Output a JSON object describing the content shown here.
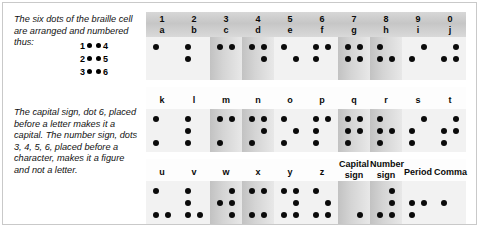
{
  "text": {
    "paragraph_1": "The six dots of the braille cell are arranged and numbered thus:",
    "paragraph_2": "The capital sign, dot 6, placed before a letter makes it a capital. The number sign, dots 3, 4, 5, 6, placed before a character, makes it a figure and not a letter."
  },
  "legend": {
    "rows": [
      {
        "left_number": "1",
        "right_number": "4"
      },
      {
        "left_number": "2",
        "right_number": "5"
      },
      {
        "left_number": "3",
        "right_number": "6"
      }
    ]
  },
  "table": {
    "rows": [
      {
        "header_style": "two-line",
        "headers": [
          {
            "top": "1",
            "bottom": "a"
          },
          {
            "top": "2",
            "bottom": "b"
          },
          {
            "top": "3",
            "bottom": "c"
          },
          {
            "top": "4",
            "bottom": "d"
          },
          {
            "top": "5",
            "bottom": "e"
          },
          {
            "top": "6",
            "bottom": "f"
          },
          {
            "top": "7",
            "bottom": "g"
          },
          {
            "top": "8",
            "bottom": "h"
          },
          {
            "top": "9",
            "bottom": "i"
          },
          {
            "top": "0",
            "bottom": "j"
          }
        ],
        "cells": [
          {
            "label": "a",
            "dots": [
              1
            ]
          },
          {
            "label": "b",
            "dots": [
              1,
              2
            ]
          },
          {
            "label": "c",
            "dots": [
              1,
              4
            ]
          },
          {
            "label": "d",
            "dots": [
              1,
              4,
              5
            ]
          },
          {
            "label": "e",
            "dots": [
              1,
              5
            ]
          },
          {
            "label": "f",
            "dots": [
              1,
              2,
              4
            ]
          },
          {
            "label": "g",
            "dots": [
              1,
              2,
              4,
              5
            ]
          },
          {
            "label": "h",
            "dots": [
              1,
              2,
              5
            ]
          },
          {
            "label": "i",
            "dots": [
              2,
              4
            ]
          },
          {
            "label": "j",
            "dots": [
              2,
              4,
              5
            ]
          }
        ]
      },
      {
        "header_style": "one-line",
        "headers": [
          {
            "top": "",
            "bottom": "k"
          },
          {
            "top": "",
            "bottom": "l"
          },
          {
            "top": "",
            "bottom": "m"
          },
          {
            "top": "",
            "bottom": "n"
          },
          {
            "top": "",
            "bottom": "o"
          },
          {
            "top": "",
            "bottom": "p"
          },
          {
            "top": "",
            "bottom": "q"
          },
          {
            "top": "",
            "bottom": "r"
          },
          {
            "top": "",
            "bottom": "s"
          },
          {
            "top": "",
            "bottom": "t"
          }
        ],
        "cells": [
          {
            "label": "k",
            "dots": [
              1,
              3
            ]
          },
          {
            "label": "l",
            "dots": [
              1,
              2,
              3
            ]
          },
          {
            "label": "m",
            "dots": [
              1,
              3,
              4
            ]
          },
          {
            "label": "n",
            "dots": [
              1,
              3,
              4,
              5
            ]
          },
          {
            "label": "o",
            "dots": [
              1,
              3,
              5
            ]
          },
          {
            "label": "p",
            "dots": [
              1,
              2,
              3,
              4
            ]
          },
          {
            "label": "q",
            "dots": [
              1,
              2,
              3,
              4,
              5
            ]
          },
          {
            "label": "r",
            "dots": [
              1,
              2,
              3,
              5
            ]
          },
          {
            "label": "s",
            "dots": [
              2,
              3,
              4
            ]
          },
          {
            "label": "t",
            "dots": [
              2,
              3,
              4,
              5
            ]
          }
        ]
      },
      {
        "header_style": "mixed",
        "headers": [
          {
            "top": "",
            "bottom": "u"
          },
          {
            "top": "",
            "bottom": "v"
          },
          {
            "top": "",
            "bottom": "w"
          },
          {
            "top": "",
            "bottom": "x"
          },
          {
            "top": "",
            "bottom": "y"
          },
          {
            "top": "",
            "bottom": "z"
          },
          {
            "top": "Capital",
            "bottom": "sign"
          },
          {
            "top": "Number",
            "bottom": "sign"
          },
          {
            "top": "",
            "bottom": "Period"
          },
          {
            "top": "",
            "bottom": "Comma"
          }
        ],
        "cells": [
          {
            "label": "u",
            "dots": [
              1,
              3,
              6
            ]
          },
          {
            "label": "v",
            "dots": [
              1,
              2,
              3,
              6
            ]
          },
          {
            "label": "w",
            "dots": [
              2,
              4,
              5,
              6
            ]
          },
          {
            "label": "x",
            "dots": [
              1,
              3,
              4,
              6
            ]
          },
          {
            "label": "y",
            "dots": [
              1,
              3,
              4,
              5,
              6
            ]
          },
          {
            "label": "z",
            "dots": [
              1,
              3,
              5,
              6
            ]
          },
          {
            "label": "capital-sign",
            "dots": [
              6
            ]
          },
          {
            "label": "number-sign",
            "dots": [
              3,
              4,
              5,
              6
            ]
          },
          {
            "label": "period",
            "dots": [
              2,
              5,
              3
            ]
          },
          {
            "label": "comma",
            "dots": [
              2
            ]
          }
        ]
      }
    ]
  },
  "colors": {
    "dot": "#0b0b0b",
    "header_band": "#cfcfcf",
    "cell_shade": "#c2c2c2",
    "cell_plain": "#f2f2f2",
    "frame": "#c9c9c9",
    "text": "#111111"
  }
}
